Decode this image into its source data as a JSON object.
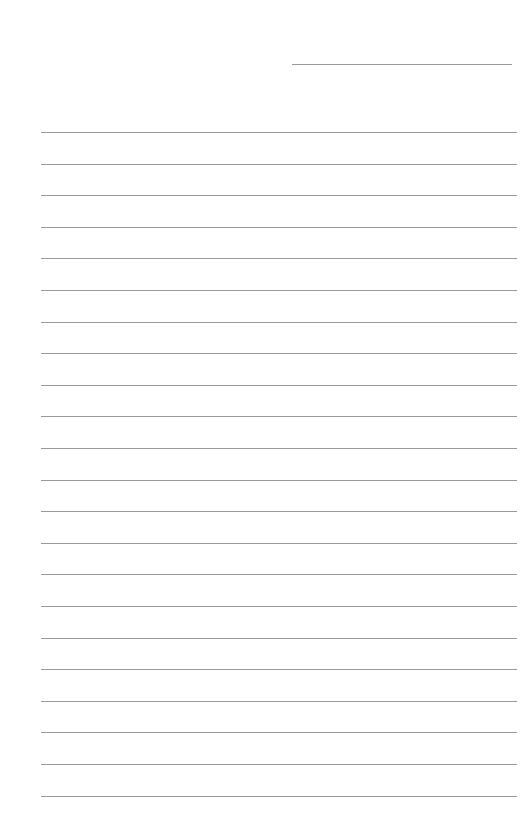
{
  "page": {
    "type": "lined-paper",
    "background_color": "#ffffff",
    "line_color": "#9a9a9a",
    "header_line": {
      "x": 292,
      "y": 64,
      "width": 220
    },
    "ruled_lines": {
      "count": 22,
      "start_y": 132,
      "spacing": 31.6,
      "x": 41,
      "width": 476
    }
  }
}
